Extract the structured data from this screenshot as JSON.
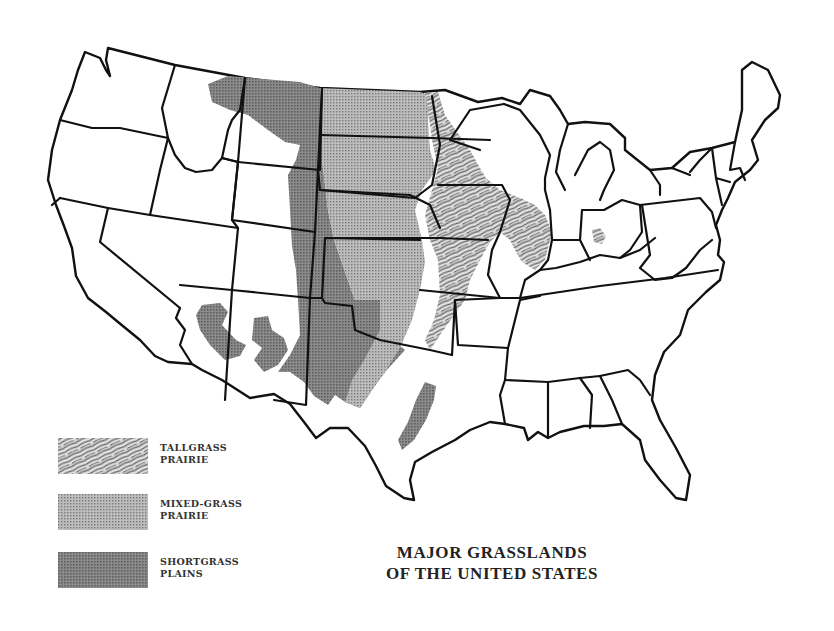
{
  "title": {
    "line1": "MAJOR GRASSLANDS",
    "line2": "OF THE UNITED STATES"
  },
  "legend": {
    "items": [
      {
        "key": "tallgrass",
        "line1": "TALLGRASS",
        "line2": "PRAIRIE",
        "pattern": "streaked-hatch",
        "color": "#8a8a8a"
      },
      {
        "key": "mixedgrass",
        "line1": "MIXED-GRASS",
        "line2": "PRAIRIE",
        "pattern": "fine-dot-screen",
        "color": "#9a9a9a"
      },
      {
        "key": "shortgrass",
        "line1": "SHORTGRASS",
        "line2": "PLAINS",
        "pattern": "dense-dot-screen",
        "color": "#6e6e6e"
      }
    ]
  },
  "colors": {
    "background": "#ffffff",
    "border": "#111111",
    "tallgrass": "#8a8a8a",
    "mixedgrass": "#9a9a9a",
    "shortgrass": "#6e6e6e"
  }
}
